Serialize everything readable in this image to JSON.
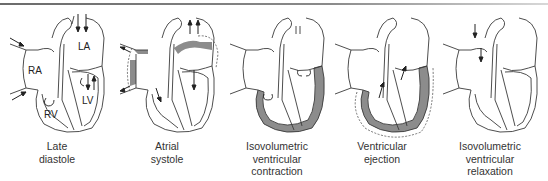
{
  "colors": {
    "outline": "#3a3a3a",
    "muscle_fill": "#8c8c8c",
    "rule": "#7a7a7a",
    "text": "#333333"
  },
  "chambers": {
    "ra": "RA",
    "rv": "RV",
    "la": "LA",
    "lv": "LV"
  },
  "panels": [
    {
      "caption_lines": [
        "Late",
        "diastole"
      ],
      "highlight": "none"
    },
    {
      "caption_lines": [
        "Atrial",
        "systole"
      ],
      "highlight": "atria"
    },
    {
      "caption_lines": [
        "Isovolumetric",
        "ventricular",
        "contraction"
      ],
      "highlight": "ventricles"
    },
    {
      "caption_lines": [
        "Ventricular",
        "ejection"
      ],
      "highlight": "ventricles"
    },
    {
      "caption_lines": [
        "Isovolumetric",
        "ventricular",
        "relaxation"
      ],
      "highlight": "none"
    }
  ]
}
